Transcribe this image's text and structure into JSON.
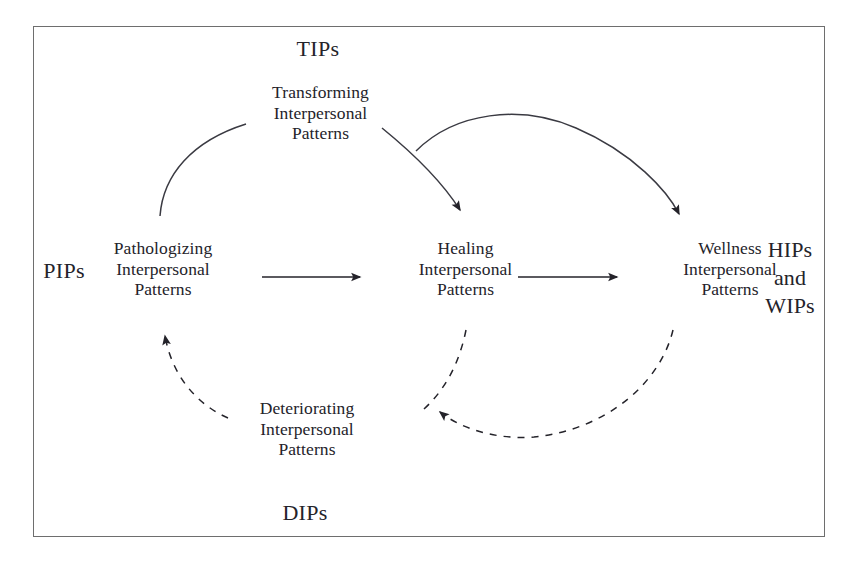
{
  "diagram": {
    "title_acronyms": {
      "top": "TIPs",
      "bottom": "DIPs",
      "left": "PIPs",
      "right": "HIPs\nand\nWIPs"
    },
    "nodes": [
      {
        "id": "pathologizing",
        "label": "Pathologizing\nInterpersonal\nPatterns"
      },
      {
        "id": "healing",
        "label": "Healing\nInterpersonal\nPatterns"
      },
      {
        "id": "wellness",
        "label": "Wellness\nInterpersonal\nPatterns"
      },
      {
        "id": "transforming",
        "label": "Transforming\nInterpersonal\nPatterns"
      },
      {
        "id": "deteriorating",
        "label": "Deteriorating\nInterpersonal\nPatterns"
      }
    ],
    "edges": [
      {
        "id": "pathologizing-to-healing",
        "style": "solid",
        "arrow": "end"
      },
      {
        "id": "healing-to-wellness",
        "style": "solid",
        "arrow": "end"
      },
      {
        "id": "pathologizing-to-transforming",
        "style": "solid",
        "arrow": "none"
      },
      {
        "id": "transforming-to-healing",
        "style": "solid",
        "arrow": "end"
      },
      {
        "id": "transforming-to-wellness",
        "style": "solid",
        "arrow": "end"
      },
      {
        "id": "deteriorating-to-pathologizing",
        "style": "dashed",
        "arrow": "end"
      },
      {
        "id": "healing-to-deteriorating",
        "style": "dashed",
        "arrow": "none"
      },
      {
        "id": "wellness-to-deteriorating",
        "style": "dashed",
        "arrow": "end"
      }
    ],
    "colors": {
      "stroke": "#3a3a42",
      "text": "#24232a",
      "frame": "#6e6e6e",
      "background": "#ffffff"
    }
  }
}
